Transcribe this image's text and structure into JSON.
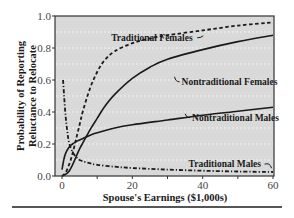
{
  "chart_data": {
    "type": "line",
    "title": "",
    "xlabel": "Spouse's Earnings ($1,000s)",
    "ylabel": "Probability of Reporting Reluctance to Relocate",
    "ylabel_lines": [
      "Probability of Reporting",
      "Reluctance to Relocate"
    ],
    "xlim": [
      -2,
      60
    ],
    "ylim": [
      0.0,
      1.0
    ],
    "x_ticks": [
      0,
      20,
      40,
      60
    ],
    "x_tick_labels": [
      "0",
      "20",
      "40",
      "60"
    ],
    "x_minor_ticks": [
      10,
      30,
      50
    ],
    "y_ticks": [
      0.0,
      0.2,
      0.4,
      0.6,
      0.8,
      1.0
    ],
    "y_tick_labels": [
      "0.0",
      "0.2",
      "0.4",
      "0.6",
      "0.8",
      "1.0"
    ],
    "grid": {
      "y": true,
      "y_step": 0.1,
      "style": "dotted"
    },
    "background": "#d9d9d9",
    "legend": "inline labels",
    "series": [
      {
        "name": "Traditional Females",
        "style": "dashed",
        "x": [
          0,
          1,
          2,
          3,
          4,
          5,
          6,
          8,
          10,
          12,
          15,
          20,
          25,
          30,
          40,
          50,
          60
        ],
        "values": [
          0.0,
          0.02,
          0.07,
          0.14,
          0.23,
          0.32,
          0.41,
          0.55,
          0.65,
          0.72,
          0.78,
          0.83,
          0.86,
          0.88,
          0.91,
          0.94,
          0.96
        ],
        "label_pos": {
          "x": 14,
          "y": 0.845
        },
        "anchor": {
          "x": 22,
          "y": 0.835
        }
      },
      {
        "name": "Nontraditional Females",
        "style": "solid",
        "x": [
          0,
          1,
          2,
          3,
          4,
          5,
          6,
          7,
          8,
          10,
          12,
          15,
          20,
          25,
          30,
          40,
          50,
          60
        ],
        "values": [
          0.0,
          0.01,
          0.03,
          0.07,
          0.12,
          0.17,
          0.21,
          0.25,
          0.29,
          0.36,
          0.43,
          0.51,
          0.61,
          0.68,
          0.73,
          0.79,
          0.84,
          0.88
        ],
        "label_pos": {
          "x": 34,
          "y": 0.57
        },
        "anchor": {
          "x": 30.5,
          "y": 0.72
        }
      },
      {
        "name": "Nontraditional Males",
        "style": "solid",
        "x": [
          0,
          0.5,
          1,
          2,
          3,
          4,
          5,
          6,
          8,
          10,
          15,
          20,
          30,
          40,
          50,
          60
        ],
        "values": [
          0.04,
          0.1,
          0.14,
          0.18,
          0.2,
          0.215,
          0.225,
          0.235,
          0.255,
          0.27,
          0.3,
          0.32,
          0.35,
          0.38,
          0.405,
          0.43
        ],
        "label_pos": {
          "x": 37,
          "y": 0.345
        },
        "anchor": {
          "x": 35,
          "y": 0.36
        }
      },
      {
        "name": "Traditional Males",
        "style": "dash-dot",
        "x": [
          0.3,
          0.6,
          1,
          1.5,
          2,
          3,
          4,
          5,
          7,
          10,
          15,
          20,
          30,
          40,
          50,
          60
        ],
        "values": [
          0.6,
          0.5,
          0.38,
          0.28,
          0.21,
          0.15,
          0.12,
          0.1,
          0.085,
          0.07,
          0.058,
          0.05,
          0.04,
          0.033,
          0.028,
          0.025
        ],
        "label_pos": {
          "x": 36,
          "y": 0.055
        },
        "anchor": {
          "x": 57,
          "y": 0.04
        }
      }
    ]
  }
}
